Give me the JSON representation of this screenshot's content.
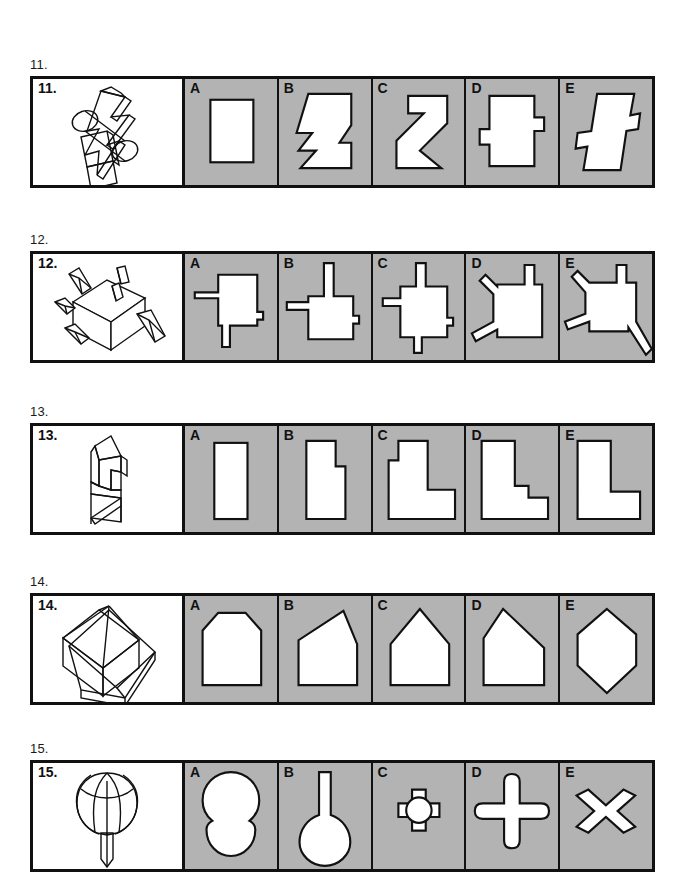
{
  "page": {
    "kind": "spatial-reasoning-test-sheet",
    "background_color": "#ffffff",
    "option_panel_color": "#b3b3b3",
    "ink_color": "#111111"
  },
  "questions": [
    {
      "outer_label": "11.",
      "inner_label": "11.",
      "stem_figure": "3d-lightning-bolt-block-with-cylinders",
      "options": [
        {
          "letter": "A",
          "shape": "plain-rectangle"
        },
        {
          "letter": "B",
          "shape": "zigzag-step-polygon"
        },
        {
          "letter": "C",
          "shape": "diagonal-s-band-polygon"
        },
        {
          "letter": "D",
          "shape": "rectangle-with-side-tabs"
        },
        {
          "letter": "E",
          "shape": "slanted-notched-parallelogram"
        }
      ]
    },
    {
      "outer_label": "12.",
      "inner_label": "12.",
      "stem_figure": "cube-with-protruding-rods",
      "options": [
        {
          "letter": "A",
          "shape": "block-with-left-rod-and-bottom-rod"
        },
        {
          "letter": "B",
          "shape": "block-with-top-rod-and-left-rod"
        },
        {
          "letter": "C",
          "shape": "block-with-top-left-bottom-rods"
        },
        {
          "letter": "D",
          "shape": "block-with-angled-rods-and-top-rod"
        },
        {
          "letter": "E",
          "shape": "block-with-three-angled-rods"
        }
      ]
    },
    {
      "outer_label": "13.",
      "inner_label": "13.",
      "stem_figure": "3d-folded-stepped-prism",
      "options": [
        {
          "letter": "A",
          "shape": "tall-plain-rectangle"
        },
        {
          "letter": "B",
          "shape": "tall-rectangle-with-right-notch"
        },
        {
          "letter": "C",
          "shape": "l-shape-with-left-notch"
        },
        {
          "letter": "D",
          "shape": "l-shape-with-stair-step"
        },
        {
          "letter": "E",
          "shape": "plain-l-shape"
        }
      ]
    },
    {
      "outer_label": "14.",
      "inner_label": "14.",
      "stem_figure": "3d-pyramid-on-box-with-base-plate",
      "options": [
        {
          "letter": "A",
          "shape": "house-with-clipped-corners"
        },
        {
          "letter": "B",
          "shape": "skewed-house-pentagon"
        },
        {
          "letter": "C",
          "shape": "house-pentagon-centered-peak"
        },
        {
          "letter": "D",
          "shape": "house-pentagon-left-peak"
        },
        {
          "letter": "E",
          "shape": "vertical-hexagon"
        }
      ]
    },
    {
      "outer_label": "15.",
      "inner_label": "15.",
      "stem_figure": "bulb-flower-with-stem",
      "options": [
        {
          "letter": "A",
          "shape": "two-stacked-circles"
        },
        {
          "letter": "B",
          "shape": "circle-with-vertical-stem"
        },
        {
          "letter": "C",
          "shape": "small-rounded-cross"
        },
        {
          "letter": "D",
          "shape": "large-rounded-cross"
        },
        {
          "letter": "E",
          "shape": "bowtie-x-shape"
        }
      ]
    }
  ]
}
